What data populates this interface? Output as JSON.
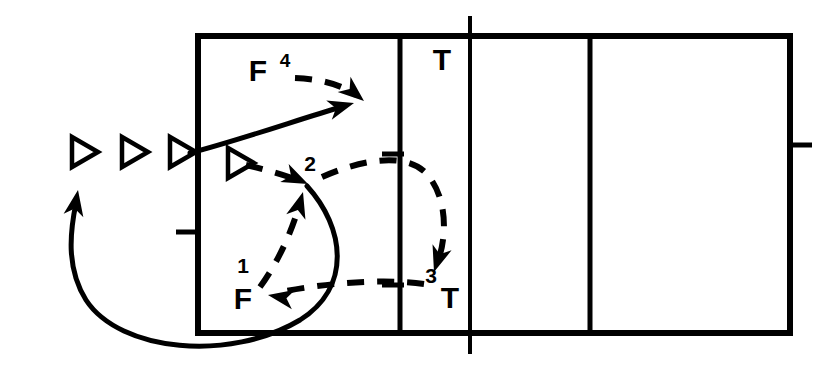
{
  "diagram": {
    "stroke_color": "#000000",
    "background_color": "#ffffff",
    "width": 836,
    "height": 374,
    "court": {
      "name": "court-outline",
      "left": 198,
      "top": 36,
      "right": 790,
      "bottom": 333,
      "line_width": 6,
      "interior_lines": [
        {
          "name": "attack-line-left",
          "x": 400,
          "y1": 36,
          "y2": 333,
          "width": 5
        },
        {
          "name": "center-line-net",
          "x": 470,
          "y1": 18,
          "y2": 352,
          "width": 4
        },
        {
          "name": "attack-line-right",
          "x": 590,
          "y1": 36,
          "y2": 333,
          "width": 5
        }
      ],
      "ticks": [
        {
          "name": "left-sideline-tick",
          "x1": 176,
          "x2": 198,
          "y": 232,
          "width": 5
        },
        {
          "name": "right-sideline-tick",
          "x1": 790,
          "x2": 812,
          "y": 145,
          "width": 5
        },
        {
          "name": "attack-line-tick-upper",
          "x1": 382,
          "x2": 404,
          "y": 154,
          "width": 5
        },
        {
          "name": "attack-line-tick-lower",
          "x1": 382,
          "x2": 404,
          "y": 285,
          "width": 5
        }
      ]
    },
    "player_markers": [
      {
        "name": "player-triangle-1",
        "label": "triangle",
        "x": 72,
        "y": 152
      },
      {
        "name": "player-triangle-2",
        "label": "triangle",
        "x": 122,
        "y": 152
      },
      {
        "name": "player-triangle-3",
        "label": "triangle",
        "x": 170,
        "y": 152
      },
      {
        "name": "player-triangle-4",
        "label": "triangle",
        "x": 228,
        "y": 163
      }
    ],
    "labels": [
      {
        "name": "label-F-top",
        "text": "F",
        "x": 258,
        "y": 73,
        "style": "letter"
      },
      {
        "name": "label-4-superscript",
        "text": "4",
        "x": 285,
        "y": 62,
        "style": "superscript"
      },
      {
        "name": "label-2",
        "text": "2",
        "x": 310,
        "y": 165,
        "style": "number"
      },
      {
        "name": "label-1",
        "text": "1",
        "x": 243,
        "y": 267,
        "style": "number"
      },
      {
        "name": "label-3",
        "text": "3",
        "x": 431,
        "y": 277,
        "style": "number"
      },
      {
        "name": "label-F-bottom",
        "text": "F",
        "x": 243,
        "y": 301,
        "style": "letter"
      },
      {
        "name": "label-T-top",
        "text": "T",
        "x": 442,
        "y": 62,
        "style": "letter"
      },
      {
        "name": "label-T-bottom",
        "text": "T",
        "x": 450,
        "y": 300,
        "style": "letter"
      }
    ],
    "paths": [
      {
        "name": "path-4-ball-dashed",
        "kind": "dashed",
        "description": "ball path 4 from F to right, curving down",
        "d": "M 295 78 C 320 79 340 84 356 95",
        "width": 6,
        "dash": "17 13",
        "arrow": {
          "x": 364,
          "y": 101,
          "angle": 40
        }
      },
      {
        "name": "path-approach-solid",
        "kind": "solid",
        "description": "player approach run from left sideline up to attack zone",
        "d": "M 190 153 C 240 140 300 119 341 107",
        "width": 5,
        "arrow": {
          "x": 354,
          "y": 103,
          "angle": -16
        }
      },
      {
        "name": "path-pass-to-2-dashed",
        "kind": "dashed",
        "description": "dashed pass from inside triangle to point 2",
        "d": "M 246 165 C 268 170 288 176 300 181",
        "width": 6,
        "dash": "17 13",
        "arrow": {
          "x": 308,
          "y": 184,
          "angle": 25
        }
      },
      {
        "name": "path-set-up-to-2-dashed",
        "kind": "dashed",
        "description": "dashed set from F (bottom) rising to point 2",
        "d": "M 260 287 C 281 258 293 227 300 203",
        "width": 6,
        "dash": "17 13",
        "arrow": {
          "x": 303,
          "y": 192,
          "angle": -74
        }
      },
      {
        "name": "path-2-to-3-dashed",
        "kind": "dashed",
        "description": "dashed ball path from 2 across the attack line and curving down to 3",
        "d": "M 322 177 C 360 160 404 152 425 172 C 448 196 447 236 438 261",
        "width": 6,
        "dash": "17 13",
        "arrow": {
          "x": 434,
          "y": 272,
          "angle": 108
        }
      },
      {
        "name": "path-3-to-F-dashed",
        "kind": "dashed",
        "description": "dashed return from 3 back across to F at bottom left",
        "d": "M 424 284 C 380 278 320 284 281 292",
        "width": 6,
        "dash": "17 13",
        "arrow": {
          "x": 268,
          "y": 295,
          "angle": 190
        }
      },
      {
        "name": "path-recovery-solid",
        "kind": "solid",
        "description": "long solid recovery run from point 2 sweeping around bottom left and back up",
        "d": "M 307 186 C 345 228 352 287 300 320 C 230 362 120 352 86 300 C 66 268 70 232 76 203",
        "width": 5,
        "arrow": {
          "x": 78,
          "y": 190,
          "angle": -80
        }
      }
    ]
  }
}
